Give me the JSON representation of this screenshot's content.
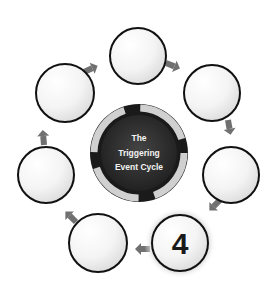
{
  "diagram": {
    "title_lines": [
      "The",
      "Triggering",
      "Event Cycle"
    ],
    "highlighted_step": "4",
    "nodes": [
      {
        "id": "top",
        "label": ""
      },
      {
        "id": "upper-right",
        "label": ""
      },
      {
        "id": "right",
        "label": ""
      },
      {
        "id": "bottom-right",
        "label": "4"
      },
      {
        "id": "bottom-left",
        "label": ""
      },
      {
        "id": "left",
        "label": ""
      },
      {
        "id": "upper-left",
        "label": ""
      }
    ],
    "colors": {
      "center_dark": "#2e2e2e",
      "ring": "#bdbdbd",
      "arrow": "#707070",
      "node_border": "#111111",
      "highlight_glow": "#cfcfcf"
    }
  }
}
